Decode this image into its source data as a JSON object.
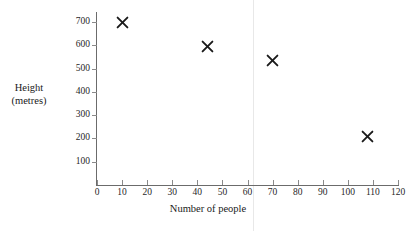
{
  "chart_data": {
    "type": "scatter",
    "title": "",
    "xlabel": "Number of people",
    "ylabel": "Height (metres)",
    "ylabel_lines": [
      "Height",
      "(metres)"
    ],
    "xlim": [
      0,
      123
    ],
    "ylim": [
      0,
      735
    ],
    "grid": false,
    "legend": null,
    "marker": "x",
    "marker_color": "#1a1a1a",
    "axis_color": "#6b6b6b",
    "xticks": [
      0,
      10,
      20,
      30,
      40,
      50,
      60,
      70,
      80,
      90,
      100,
      110,
      120
    ],
    "xtick_labels": [
      "0",
      "10",
      "20",
      "30",
      "40",
      "50",
      "60",
      "70",
      "80",
      "90",
      "100",
      "110",
      "120"
    ],
    "yticks": [
      100,
      200,
      300,
      400,
      500,
      600,
      700
    ],
    "ytick_labels": [
      "100",
      "200",
      "300",
      "400",
      "500",
      "600",
      "700"
    ],
    "points": [
      {
        "x": 10,
        "y": 700
      },
      {
        "x": 44,
        "y": 595
      },
      {
        "x": 70,
        "y": 535
      },
      {
        "x": 108,
        "y": 210
      }
    ]
  }
}
